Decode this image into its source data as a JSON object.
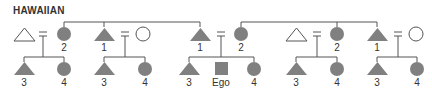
{
  "title": "HAWAIIAN",
  "colors": {
    "filled": "#808080",
    "line": "#555555",
    "text": "#333333",
    "background": "#ffffff"
  },
  "legend_semantics": {
    "triangle": "male",
    "circle": "female",
    "square": "Ego",
    "filled": "kin term applied",
    "outline": "affine / not labeled",
    "equals": "marriage"
  },
  "generation_1": [
    {
      "shape": "triangle",
      "filled": false,
      "label": ""
    },
    {
      "shape": "circle",
      "filled": true,
      "label": "2"
    },
    {
      "shape": "triangle",
      "filled": true,
      "label": "1"
    },
    {
      "shape": "circle",
      "filled": false,
      "label": ""
    },
    {
      "shape": "triangle",
      "filled": true,
      "label": "1"
    },
    {
      "shape": "circle",
      "filled": true,
      "label": "2"
    },
    {
      "shape": "triangle",
      "filled": false,
      "label": ""
    },
    {
      "shape": "circle",
      "filled": true,
      "label": "2"
    },
    {
      "shape": "triangle",
      "filled": true,
      "label": "1"
    },
    {
      "shape": "circle",
      "filled": false,
      "label": ""
    }
  ],
  "generation_2": [
    {
      "shape": "triangle",
      "filled": true,
      "label": "3"
    },
    {
      "shape": "circle",
      "filled": true,
      "label": "4"
    },
    {
      "shape": "triangle",
      "filled": true,
      "label": "3"
    },
    {
      "shape": "circle",
      "filled": true,
      "label": "4"
    },
    {
      "shape": "triangle",
      "filled": true,
      "label": "3"
    },
    {
      "shape": "square",
      "filled": true,
      "label": "Ego"
    },
    {
      "shape": "circle",
      "filled": true,
      "label": "4"
    },
    {
      "shape": "triangle",
      "filled": true,
      "label": "3"
    },
    {
      "shape": "circle",
      "filled": true,
      "label": "4"
    },
    {
      "shape": "triangle",
      "filled": true,
      "label": "3"
    },
    {
      "shape": "circle",
      "filled": true,
      "label": "4"
    }
  ]
}
